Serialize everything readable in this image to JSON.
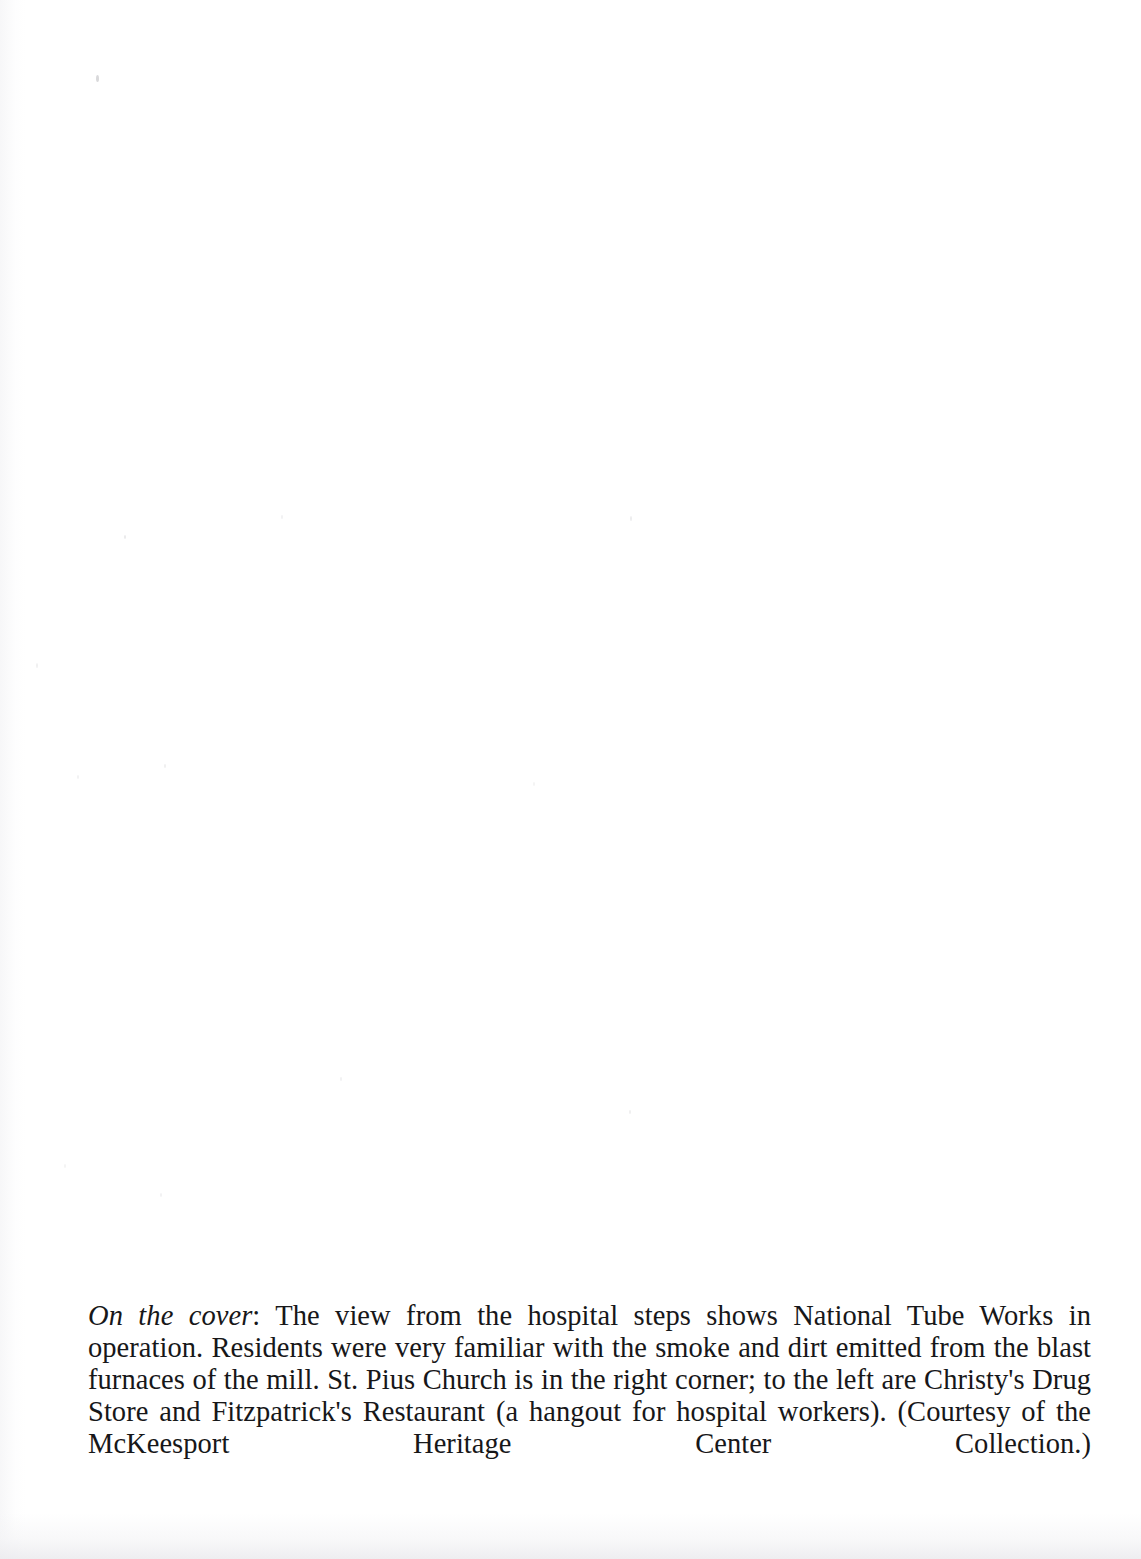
{
  "page": {
    "kind": "book-caption-page",
    "background_color": "#ffffff",
    "text_color": "#171719"
  },
  "caption": {
    "lead_label": "On the cover",
    "lead_separator": ": ",
    "body": "The view from the hospital steps shows National Tube Works in operation. Residents were very familiar with the smoke and dirt emitted from the blast furnaces of the mill. St. Pius Church is in the right corner; to the left are Christy's Drug Store and Fitzpatrick's Restaurant (a hangout for hospital workers). (Courtesy of the McKeesport Heritage Center Collection.)",
    "full_text": "On the cover: The view from the hospital steps shows National Tube Works in operation. Residents were very familiar with the smoke and dirt emitted from the blast furnaces of the mill. St. Pius Church is in the right corner; to the left are Christy's Drug Store and Fitzpatrick's Restaurant (a hangout for hospital workers). (Courtesy of the McKeesport Heritage Center Collection.)",
    "lines": [
      "On the cover: The view from the hospital steps shows National Tube Works in operation. Residents",
      "were very familiar with the smoke and dirt emitted from the blast furnaces of the mill. St. Pius",
      "Church is in the right corner; to the left are Christy's Drug Store and Fitzpatrick's Restaurant (a",
      "hangout for hospital workers). (Courtesy of the McKeesport Heritage Center Collection.)"
    ]
  }
}
